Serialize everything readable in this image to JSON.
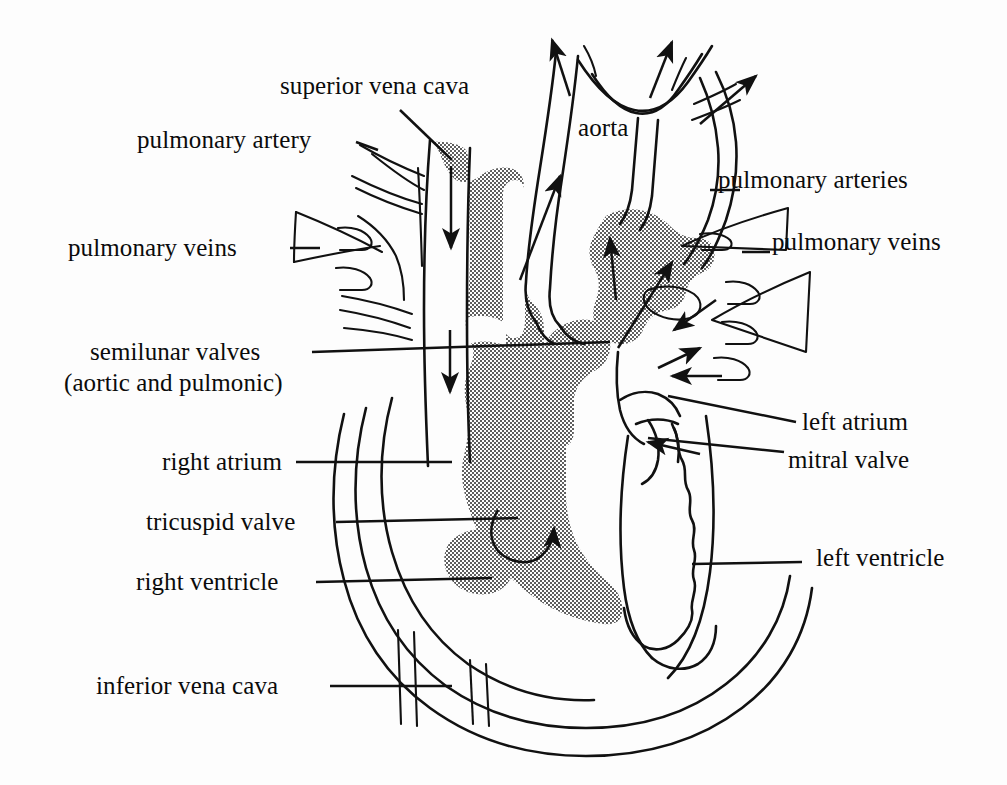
{
  "figure": {
    "background_color": "#fdfdfd",
    "ink_color": "#111111",
    "shading_color": "#9a9a9a",
    "shading_style": "halftone-stipple-50-percent"
  },
  "labels": {
    "superior_vena_cava": "superior vena cava",
    "pulmonary_artery": "pulmonary artery",
    "pulmonary_veins_left": "pulmonary veins",
    "semilunar_valves_line1": "semilunar valves",
    "semilunar_valves_line2": "(aortic and pulmonic)",
    "right_atrium": "right atrium",
    "tricuspid_valve": "tricuspid valve",
    "right_ventricle": "right ventricle",
    "inferior_vena_cava": "inferior vena cava",
    "aorta": "aorta",
    "pulmonary_arteries_right": "pulmonary arteries",
    "pulmonary_veins_right": "pulmonary veins",
    "left_atrium": "left atrium",
    "mitral_valve": "mitral valve",
    "left_ventricle": "left ventricle"
  },
  "structures": [
    {
      "name": "superior-vena-cava",
      "side": "left",
      "shaded": true,
      "flow": "down"
    },
    {
      "name": "pulmonary-artery",
      "side": "left",
      "shaded": false,
      "flow": "out"
    },
    {
      "name": "pulmonary-veins-left",
      "side": "left",
      "shaded": false,
      "flow": "in"
    },
    {
      "name": "semilunar-valves",
      "side": "center",
      "shaded": false,
      "flow": "none"
    },
    {
      "name": "right-atrium",
      "side": "left",
      "shaded": true,
      "flow": "down"
    },
    {
      "name": "tricuspid-valve",
      "side": "center",
      "shaded": false,
      "flow": "none"
    },
    {
      "name": "right-ventricle",
      "side": "left",
      "shaded": true,
      "flow": "up"
    },
    {
      "name": "inferior-vena-cava",
      "side": "left",
      "shaded": false,
      "flow": "in"
    },
    {
      "name": "aorta",
      "side": "center",
      "shaded": false,
      "flow": "out"
    },
    {
      "name": "pulmonary-arteries-right",
      "side": "right",
      "shaded": false,
      "flow": "out"
    },
    {
      "name": "pulmonary-veins-right",
      "side": "right",
      "shaded": false,
      "flow": "in"
    },
    {
      "name": "left-atrium",
      "side": "right",
      "shaded": false,
      "flow": "in"
    },
    {
      "name": "mitral-valve",
      "side": "right",
      "shaded": false,
      "flow": "none"
    },
    {
      "name": "left-ventricle",
      "side": "right",
      "shaded": false,
      "flow": "out"
    }
  ],
  "flow_arrows": [
    {
      "name": "svc-inflow-arrow",
      "direction": "down",
      "region": "superior vena cava"
    },
    {
      "name": "right-atrium-inflow-arrow",
      "direction": "down",
      "region": "right atrium"
    },
    {
      "name": "tricuspid-flow-arrow",
      "direction": "curved-up",
      "region": "right ventricle"
    },
    {
      "name": "aorta-outflow-arrow",
      "direction": "up-right",
      "region": "aorta"
    },
    {
      "name": "aortic-branch-arrow-1",
      "direction": "up",
      "region": "aortic arch branch"
    },
    {
      "name": "aortic-branch-arrow-2",
      "direction": "up-right",
      "region": "aortic arch branch"
    },
    {
      "name": "aortic-branch-arrow-3",
      "direction": "right",
      "region": "aortic arch branch"
    },
    {
      "name": "pulmonary-trunk-arrow",
      "direction": "up",
      "region": "pulmonary trunk"
    },
    {
      "name": "pulmonary-outflow-arrow",
      "direction": "up-right",
      "region": "pulmonary artery"
    },
    {
      "name": "left-atrium-inflow-arrow-1",
      "direction": "down-left",
      "region": "left atrium"
    },
    {
      "name": "left-atrium-inflow-arrow-2",
      "direction": "left",
      "region": "left atrium"
    },
    {
      "name": "left-ventricle-outflow-arrow",
      "direction": "up-left",
      "region": "left ventricle"
    },
    {
      "name": "mitral-flow-arrow",
      "direction": "left",
      "region": "mitral valve"
    }
  ]
}
